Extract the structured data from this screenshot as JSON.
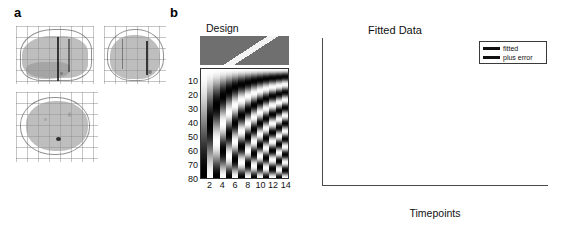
{
  "figure": {
    "panels": [
      {
        "letter": "a",
        "name": "glass-brain-maximum-intensity-projections"
      },
      {
        "letter": "b",
        "name": "design-and-fitted-data"
      }
    ]
  },
  "panel_a": {
    "label": "a",
    "views": [
      {
        "name": "sagittal-view"
      },
      {
        "name": "coronal-view"
      },
      {
        "name": "axial-view"
      }
    ]
  },
  "panel_b": {
    "label": "b",
    "design": {
      "title": "Design",
      "ylabel_letters": [
        "T",
        "i",
        "m",
        "e",
        "p",
        "o",
        "i",
        "n",
        "t"
      ],
      "ylabel": "Timepoint",
      "yticks": [
        10,
        20,
        30,
        40,
        50,
        60,
        70,
        80
      ],
      "xticks": [
        2,
        4,
        6,
        8,
        10,
        12,
        14
      ]
    }
  },
  "chart_data": [
    {
      "type": "heatmap",
      "name": "design-matrix",
      "title": "Design",
      "xlabel": "",
      "ylabel": "Timepoint",
      "xticks": [
        2,
        4,
        6,
        8,
        10,
        12,
        14
      ],
      "yticks": [
        10,
        20,
        30,
        40,
        50,
        60,
        70,
        80
      ],
      "xlim": [
        1,
        14
      ],
      "ylim": [
        80,
        1
      ],
      "n_columns": 14,
      "n_rows": 80,
      "colormap": "gray",
      "description": "Discrete cosine transform basis set; column k is a half-cosine of frequency k across 80 timepoints, so stripe frequency increases left to right.",
      "top_strip": {
        "name": "design-top-strip",
        "description": "Gray panel with a bright white diagonal band running from upper-left to lower-right."
      }
    },
    {
      "type": "line",
      "name": "fitted-data-plot",
      "title": "Fitted Data",
      "xlabel": "Timepoints",
      "ylabel": "",
      "xlim": [
        0,
        250
      ],
      "ylim": [
        -40,
        40
      ],
      "xticks": [
        0,
        50,
        100,
        150,
        200,
        250
      ],
      "yticks": [
        40,
        30,
        20,
        10,
        0,
        -10,
        -20,
        -30,
        -40
      ],
      "grid": false,
      "legend_position": "upper-right",
      "series": [
        {
          "name": "fitted",
          "color": "#b4b4b4",
          "x": [
            0,
            5,
            10,
            15,
            20,
            25,
            30,
            35,
            40,
            45,
            50,
            55,
            60,
            65,
            70,
            75,
            80,
            85,
            90,
            95,
            100,
            105,
            110,
            115,
            120,
            125,
            130,
            135,
            140,
            145,
            150,
            155,
            160,
            165,
            170,
            175,
            180,
            185,
            190,
            195,
            200,
            205,
            210,
            215,
            220,
            225,
            230,
            235,
            240
          ],
          "y": [
            10,
            10,
            8,
            4,
            -2,
            -10,
            -19,
            -27,
            -32,
            -33.5,
            -32,
            -27,
            -20,
            -12,
            -4,
            5,
            13,
            20,
            23.5,
            24.5,
            23.5,
            20,
            14,
            6,
            -4,
            -15,
            -26,
            -34,
            -36.5,
            -33,
            -24,
            -12,
            2,
            16,
            27,
            34,
            37.5,
            38,
            36,
            31,
            23,
            13,
            3,
            -7,
            -15,
            -21,
            -24,
            -25.5,
            -25
          ]
        },
        {
          "name": "plus error",
          "color": "#2b2b2b",
          "note": "legend entry only; trace hidden behind fitted curve"
        }
      ],
      "legend": [
        {
          "label": "fitted",
          "color": "#b4b4b4"
        },
        {
          "label": "plus error",
          "color": "#2b2b2b"
        }
      ]
    }
  ]
}
